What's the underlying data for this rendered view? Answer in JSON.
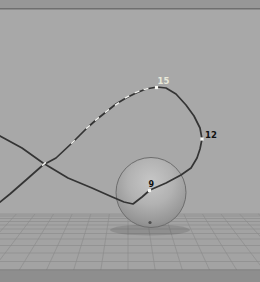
{
  "viewport": {
    "kind": "3d-perspective-view",
    "width": 260,
    "height": 282,
    "colors": {
      "background": "#a8a8a8",
      "floor": "#a3a3a3",
      "grid_line": "#8d8d8d",
      "top_band": "#979797",
      "top_band_edge": "#6f6f6f",
      "bottom_band": "#8e8e8e",
      "bottom_band_edge": "#757575",
      "curve": "#343434",
      "tick": "#f1f1ee",
      "marker": "#f6f6f2",
      "label_dark": "#111111",
      "label_light": "#e9e9da",
      "sphere_rim": "#6d6d6d",
      "sphere_stop_0": "#c6c6c6",
      "sphere_stop_1": "#b2b2b2",
      "sphere_stop_2": "#969696",
      "sphere_stop_3": "#7a7a7a",
      "pivot_dot": "#4e4e4e"
    }
  },
  "grid": {
    "horizon_y": 214,
    "bottom_y": 270,
    "rows_y": [
      214,
      216,
      218.5,
      221.5,
      225,
      229,
      233.5,
      239,
      245.5,
      253,
      261.5
    ],
    "vanishing_point": {
      "x": 128,
      "y": 92
    },
    "verticals_bottom_x": [
      -75,
      -46,
      -17,
      12,
      41,
      70,
      99,
      128,
      157,
      186,
      215,
      244,
      273,
      302,
      331
    ],
    "bottom_band_top": 270,
    "top_band_height": 8
  },
  "sphere": {
    "cx": 151,
    "cy": 192.5,
    "r": 35,
    "pivot": {
      "x": 150,
      "y": 222.5,
      "r": 1.6
    },
    "shadow": {
      "cx": 150,
      "cy": 230,
      "rx": 40,
      "ry": 5.5,
      "opacity": 0.12
    }
  },
  "motion_path": {
    "d": "M 0,136 L 22,148 L 43,163 L 68,178 L 92,188 L 110,196 L 124,202 L 133,204 L 142,197 L 150,190 L 166,183 L 181,175 L 191,168 L 197,158 L 200,149 L 202,139 L 200,128 L 194,116 L 186,105 L 176,94 L 166,88 L 157,87 L 146,89 L 136,93 L 126,98 L 116,104 L 106,112 L 96,120 L 87,128 L 72,143 L 56,158 L 43,165 L 26,180 L 10,194 L 0,202",
    "stroke_width": 1.7,
    "keys": [
      {
        "frame": "9",
        "x": 149.5,
        "y": 190.5,
        "label_x": 148.5,
        "label_y": 187,
        "label_style": "dark",
        "font_size": 8
      },
      {
        "frame": "12",
        "x": 202,
        "y": 139,
        "label_x": 205,
        "label_y": 138,
        "label_style": "dark",
        "font_size": 8.5
      },
      {
        "frame": "15",
        "x": 156.5,
        "y": 87.5,
        "label_x": 157.5,
        "label_y": 84,
        "label_style": "light",
        "font_size": 8.5
      }
    ],
    "marker_size": 3.2,
    "ticks_len": 5,
    "ticks": [
      {
        "x": 146,
        "y": 89,
        "a": -12
      },
      {
        "x": 137,
        "y": 92,
        "a": -20
      },
      {
        "x": 127,
        "y": 97,
        "a": -28
      },
      {
        "x": 117,
        "y": 104,
        "a": -34
      },
      {
        "x": 107,
        "y": 111,
        "a": -38
      },
      {
        "x": 97,
        "y": 119,
        "a": -40
      },
      {
        "x": 88,
        "y": 127,
        "a": -42
      },
      {
        "x": 73,
        "y": 142,
        "a": -45
      },
      {
        "x": 44,
        "y": 164,
        "a": -40
      }
    ]
  }
}
